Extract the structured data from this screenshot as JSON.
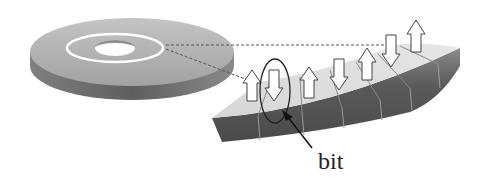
{
  "diagram": {
    "type": "magnetic-disk-recording-illustration",
    "components": [
      {
        "name": "disk",
        "description": "Gray disk platter with central hole"
      },
      {
        "name": "track",
        "description": "White circular track on disk surface"
      },
      {
        "name": "track-segment",
        "description": "Magnified curved segment of the track divided into cells"
      },
      {
        "name": "magnetization-arrows",
        "description": "Up and down arrows representing bit magnetization"
      },
      {
        "name": "bit-highlight",
        "description": "Ellipse highlighting a single bit cell"
      }
    ],
    "arrows": [
      "up",
      "down",
      "up",
      "down",
      "up",
      "down",
      "up"
    ],
    "labels": {
      "bit": "bit"
    },
    "colors": {
      "disk_top": "#b0b0b0",
      "disk_side": "#6e6e6e",
      "track": "#ffffff",
      "segment_top": "#dcdcdc",
      "segment_side": "#5a5a5a",
      "dashed_line": "#555555",
      "arrow_fill": "#ffffff",
      "arrow_stroke": "#444444"
    }
  }
}
